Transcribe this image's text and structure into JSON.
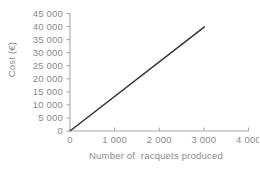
{
  "chart_data": {
    "type": "line",
    "title": "",
    "xlabel": "Number of  racquets produced",
    "ylabel": "Cost (€)",
    "x": [
      0,
      3020
    ],
    "values": [
      0,
      40000
    ],
    "series": [
      {
        "name": "Cost of racquets produced",
        "x": [
          0,
          3020
        ],
        "values": [
          0,
          40000
        ]
      }
    ],
    "xlim": [
      0,
      4000
    ],
    "ylim": [
      0,
      45000
    ],
    "xticks": [
      0,
      1000,
      2000,
      3000,
      4000
    ],
    "yticks": [
      0,
      5000,
      10000,
      15000,
      20000,
      25000,
      30000,
      35000,
      40000,
      45000
    ],
    "xtick_labels": [
      "0",
      "1 000",
      "2 000",
      "3 000",
      "4 000"
    ],
    "ytick_labels": [
      "0",
      "5 000",
      "10 000",
      "15 000",
      "20 000",
      "25 000",
      "30 000",
      "35 000",
      "40 000",
      "45 000"
    ],
    "grid": false,
    "legend": "none",
    "annotations": [],
    "line_color": "#333333",
    "axis_color": "#a9a9a9",
    "text_color": "#8a8a8a",
    "background_color": "#ffffff"
  },
  "axes": {
    "y_title": "Cost (€)",
    "x_title": "Number of  racquets produced"
  }
}
